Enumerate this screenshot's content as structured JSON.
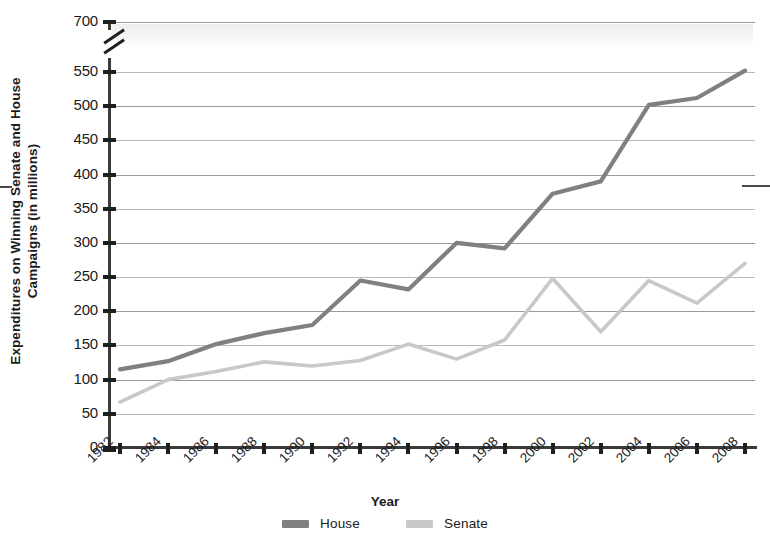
{
  "chart_data": {
    "type": "line",
    "title": "",
    "xlabel": "Year",
    "ylabel": "Expenditures on Winning Senate and House Campaigns (in millions)",
    "categories": [
      "1982",
      "1984",
      "1986",
      "1988",
      "1990",
      "1992",
      "1994",
      "1996",
      "1998",
      "2000",
      "2002",
      "2004",
      "2006",
      "2008"
    ],
    "x": [
      1982,
      1984,
      1986,
      1988,
      1990,
      1992,
      1994,
      1996,
      1998,
      2000,
      2002,
      2004,
      2006,
      2008
    ],
    "series": [
      {
        "name": "House",
        "color": "#808080",
        "values": [
          115,
          127,
          152,
          168,
          180,
          245,
          232,
          300,
          292,
          372,
          390,
          502,
          512,
          552
        ]
      },
      {
        "name": "Senate",
        "color": "#c8c8c8",
        "values": [
          67,
          100,
          112,
          126,
          120,
          128,
          152,
          130,
          158,
          248,
          170,
          245,
          212,
          270
        ]
      }
    ],
    "ylim": [
      0,
      700
    ],
    "yticks": [
      0,
      50,
      100,
      150,
      200,
      250,
      300,
      350,
      400,
      450,
      500,
      550,
      700
    ],
    "ytick_labels": [
      "0",
      "50",
      "100",
      "150",
      "200",
      "250",
      "300",
      "350",
      "400",
      "450",
      "500",
      "550",
      "700"
    ],
    "axis_break": {
      "present": true,
      "between": [
        550,
        700
      ],
      "axis": "y"
    },
    "grid": true,
    "legend_position": "bottom-center"
  },
  "legend": {
    "items": [
      {
        "label": "House",
        "color": "#808080"
      },
      {
        "label": "Senate",
        "color": "#c8c8c8"
      }
    ]
  }
}
